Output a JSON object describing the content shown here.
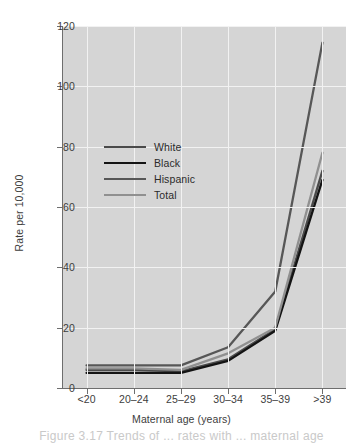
{
  "figure": {
    "caption": "Figure 3.17 Trends of ... rates with ... maternal age"
  },
  "chart_data": {
    "type": "line",
    "title": "",
    "xlabel": "Maternal age (years)",
    "ylabel": "Rate per 10,000",
    "categories": [
      "<20",
      "20–24",
      "25–29",
      "30–34",
      "35–39",
      ">39"
    ],
    "ylim": [
      0,
      120
    ],
    "yticks": [
      0,
      20,
      40,
      60,
      80,
      100,
      120
    ],
    "ytick_labels": [
      "0",
      "20",
      "40",
      "60",
      "80",
      "100",
      "120"
    ],
    "grid": true,
    "grid_color": "#f2f2f2",
    "plot_background": "#d5d5d5",
    "legend_position": "upper-left-inside",
    "series": [
      {
        "name": "White",
        "color": "#4a4a4a",
        "values": [
          6.0,
          6.0,
          5.5,
          9.5,
          19.5,
          72.0
        ]
      },
      {
        "name": "Black",
        "color": "#141414",
        "color_note": "darkest",
        "values": [
          5.0,
          5.0,
          5.0,
          9.0,
          19.0,
          69.0
        ]
      },
      {
        "name": "Hispanic",
        "color": "#575757",
        "values": [
          7.5,
          7.5,
          7.5,
          13.5,
          32.0,
          114.5
        ]
      },
      {
        "name": "Total",
        "color": "#909090",
        "values": [
          6.5,
          6.5,
          6.0,
          11.5,
          20.0,
          78.0
        ]
      }
    ]
  }
}
